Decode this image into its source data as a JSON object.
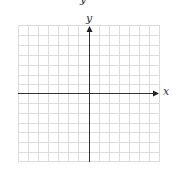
{
  "diagram": {
    "type": "coordinate-plane",
    "top_label_partial": "y",
    "x_axis_label": "x",
    "y_axis_label": "y",
    "grid": {
      "columns": 14,
      "rows": 14,
      "line_color": "#d8d8d8",
      "axis_color": "#333333"
    }
  }
}
